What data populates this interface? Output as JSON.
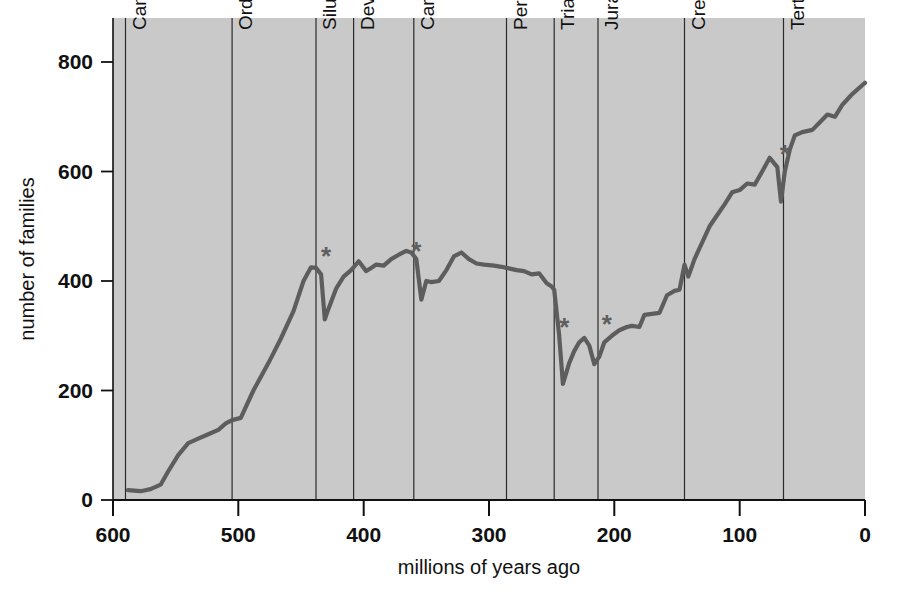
{
  "figure": {
    "title": "",
    "background_color": "#ffffff",
    "plot_fill_color": "#c9c9c9",
    "line_color": "#5d5d5d",
    "axis_color": "#111111",
    "boundary_line_color": "#2a2a2a",
    "star_color": "#5f5f5f"
  },
  "axes": {
    "x": {
      "label": "millions of years ago",
      "ticks": [
        "600",
        "500",
        "400",
        "300",
        "200",
        "100",
        "0"
      ],
      "tick_values": [
        600,
        500,
        400,
        300,
        200,
        100,
        0
      ],
      "min": 600,
      "max": 0,
      "reversed": true
    },
    "y": {
      "label": "number of families",
      "ticks": [
        "0",
        "200",
        "400",
        "600",
        "800"
      ],
      "tick_values": [
        0,
        200,
        400,
        600,
        800
      ],
      "min": 0,
      "max": 850
    }
  },
  "periods": [
    {
      "name": "Cambrian",
      "start": 590,
      "end": 505
    },
    {
      "name": "Ordovician",
      "start": 505,
      "end": 438
    },
    {
      "name": "Silurian",
      "start": 438,
      "end": 408
    },
    {
      "name": "Devonian",
      "start": 408,
      "end": 360
    },
    {
      "name": "Carboniferous",
      "start": 360,
      "end": 286
    },
    {
      "name": "Permian",
      "start": 286,
      "end": 248
    },
    {
      "name": "Triassic",
      "start": 248,
      "end": 213
    },
    {
      "name": "Jurassic",
      "start": 213,
      "end": 144
    },
    {
      "name": "Cretaceous",
      "start": 144,
      "end": 65
    },
    {
      "name": "Tertiary",
      "start": 65,
      "end": 0
    }
  ],
  "extinction_markers": [
    {
      "label": "*",
      "x": 430,
      "y": 430,
      "name": "end-ordovician-extinction"
    },
    {
      "label": "*",
      "x": 358,
      "y": 438,
      "name": "late-devonian-extinction"
    },
    {
      "label": "*",
      "x": 240,
      "y": 300,
      "name": "end-permian-extinction"
    },
    {
      "label": "*",
      "x": 206,
      "y": 305,
      "name": "end-triassic-extinction"
    },
    {
      "label": "*",
      "x": 64,
      "y": 615,
      "name": "end-cretaceous-extinction"
    }
  ],
  "chart_data": {
    "type": "line",
    "title": "",
    "subtitle": "",
    "xlabel": "millions of years ago",
    "ylabel": "number of families",
    "xlim": [
      600,
      0
    ],
    "ylim": [
      0,
      850
    ],
    "grid": false,
    "legend": "none",
    "x_axis_reversed": true,
    "annotations": [
      "Cambrian",
      "Ordovician",
      "Silurian",
      "Devonian",
      "Carboniferous",
      "Permian",
      "Triassic",
      "Jurassic",
      "Cretaceous",
      "Tertiary",
      "* mass extinction events"
    ],
    "series": [
      {
        "name": "number of marine animal families",
        "color": "#5d5d5d",
        "points": [
          [
            588,
            18
          ],
          [
            578,
            16
          ],
          [
            570,
            20
          ],
          [
            562,
            28
          ],
          [
            556,
            52
          ],
          [
            548,
            82
          ],
          [
            540,
            104
          ],
          [
            532,
            112
          ],
          [
            524,
            120
          ],
          [
            516,
            128
          ],
          [
            510,
            140
          ],
          [
            505,
            146
          ],
          [
            498,
            150
          ],
          [
            488,
            200
          ],
          [
            476,
            250
          ],
          [
            466,
            295
          ],
          [
            456,
            345
          ],
          [
            448,
            400
          ],
          [
            442,
            425
          ],
          [
            438,
            424
          ],
          [
            434,
            412
          ],
          [
            431,
            330
          ],
          [
            428,
            350
          ],
          [
            422,
            386
          ],
          [
            416,
            408
          ],
          [
            410,
            420
          ],
          [
            404,
            436
          ],
          [
            398,
            418
          ],
          [
            394,
            424
          ],
          [
            390,
            430
          ],
          [
            384,
            428
          ],
          [
            378,
            440
          ],
          [
            372,
            448
          ],
          [
            366,
            455
          ],
          [
            362,
            452
          ],
          [
            358,
            440
          ],
          [
            354,
            366
          ],
          [
            350,
            400
          ],
          [
            346,
            398
          ],
          [
            340,
            400
          ],
          [
            334,
            420
          ],
          [
            328,
            445
          ],
          [
            322,
            452
          ],
          [
            316,
            440
          ],
          [
            310,
            432
          ],
          [
            304,
            430
          ],
          [
            296,
            428
          ],
          [
            290,
            426
          ],
          [
            286,
            424
          ],
          [
            278,
            420
          ],
          [
            272,
            418
          ],
          [
            266,
            412
          ],
          [
            260,
            414
          ],
          [
            254,
            396
          ],
          [
            250,
            390
          ],
          [
            248,
            384
          ],
          [
            244,
            300
          ],
          [
            241,
            212
          ],
          [
            236,
            250
          ],
          [
            232,
            272
          ],
          [
            228,
            288
          ],
          [
            224,
            296
          ],
          [
            220,
            282
          ],
          [
            216,
            248
          ],
          [
            212,
            262
          ],
          [
            208,
            288
          ],
          [
            202,
            300
          ],
          [
            196,
            310
          ],
          [
            190,
            316
          ],
          [
            186,
            318
          ],
          [
            180,
            316
          ],
          [
            176,
            338
          ],
          [
            170,
            340
          ],
          [
            164,
            342
          ],
          [
            158,
            374
          ],
          [
            152,
            382
          ],
          [
            148,
            384
          ],
          [
            144,
            430
          ],
          [
            141,
            408
          ],
          [
            136,
            440
          ],
          [
            130,
            470
          ],
          [
            124,
            500
          ],
          [
            118,
            520
          ],
          [
            112,
            540
          ],
          [
            106,
            562
          ],
          [
            100,
            566
          ],
          [
            94,
            578
          ],
          [
            88,
            576
          ],
          [
            82,
            600
          ],
          [
            76,
            625
          ],
          [
            70,
            608
          ],
          [
            67,
            545
          ],
          [
            64,
            600
          ],
          [
            60,
            640
          ],
          [
            56,
            666
          ],
          [
            50,
            672
          ],
          [
            42,
            676
          ],
          [
            36,
            690
          ],
          [
            30,
            704
          ],
          [
            24,
            700
          ],
          [
            18,
            722
          ],
          [
            10,
            742
          ],
          [
            2,
            758
          ],
          [
            0,
            762
          ]
        ]
      }
    ]
  }
}
